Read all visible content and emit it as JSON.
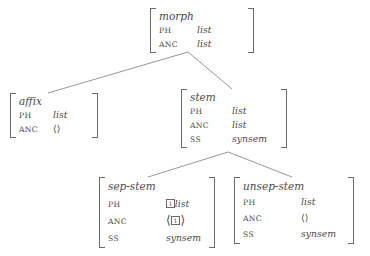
{
  "diagram": {
    "type": "type-hierarchy-avm",
    "line_color": "#8a8a8a",
    "text_color": "#4a4a4a"
  },
  "nodes": {
    "morph": {
      "type": "morph",
      "rows": [
        {
          "attr": "PH",
          "value": "list"
        },
        {
          "attr": "ANC",
          "value": "list"
        }
      ]
    },
    "affix": {
      "type": "affix",
      "rows": [
        {
          "attr": "PH",
          "value": "list"
        },
        {
          "attr": "ANC",
          "value": "⟨⟩"
        }
      ]
    },
    "stem": {
      "type": "stem",
      "rows": [
        {
          "attr": "PH",
          "value": "list"
        },
        {
          "attr": "ANC",
          "value": "list"
        },
        {
          "attr": "SS",
          "value": "synsem"
        }
      ]
    },
    "sep_stem": {
      "type": "sep-stem",
      "rows": [
        {
          "attr": "PH",
          "tag": "1",
          "value": "list"
        },
        {
          "attr": "ANC",
          "tag": "1",
          "value": "",
          "bracketed": true
        },
        {
          "attr": "SS",
          "value": "synsem"
        }
      ]
    },
    "unsep_stem": {
      "type": "unsep-stem",
      "rows": [
        {
          "attr": "PH",
          "value": "list"
        },
        {
          "attr": "ANC",
          "value": "⟨⟩"
        },
        {
          "attr": "SS",
          "value": "synsem"
        }
      ]
    }
  },
  "edges": [
    {
      "from": "morph",
      "to": "affix"
    },
    {
      "from": "morph",
      "to": "stem"
    },
    {
      "from": "stem",
      "to": "sep-stem"
    },
    {
      "from": "stem",
      "to": "unsep-stem"
    }
  ],
  "tags": {
    "one": "1"
  },
  "angle_brackets": {
    "open": "⟨",
    "close": "⟩",
    "empty": "⟨⟩"
  }
}
